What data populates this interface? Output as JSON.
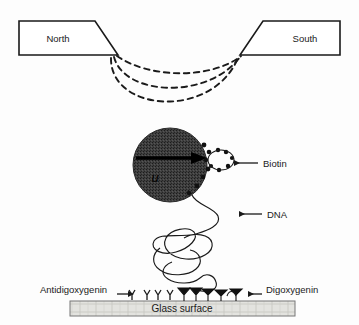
{
  "figure": {
    "type": "schematic-diagram",
    "background_color": "#fdfdfd",
    "line_color": "#1a1a1a"
  },
  "magnet": {
    "north_label": "North",
    "south_label": "South",
    "field_lines_count": 3,
    "field_line_style": "dashed"
  },
  "bead": {
    "fill_color": "#3a3a3a",
    "moment_symbol": "u",
    "moment_arrow_direction": "right"
  },
  "annotations": {
    "biotin": {
      "label": "Biotin",
      "arrow_direction": "left"
    },
    "dna": {
      "label": "DNA",
      "arrow_direction": "left"
    },
    "antidigoxygenin": {
      "label": "Antidigoxygenin",
      "arrow_direction": "right"
    },
    "digoxygenin": {
      "label": "Digoxygenin",
      "arrow_direction": "left"
    }
  },
  "surface": {
    "label": "Glass surface",
    "fill_color": "#dededa",
    "border_color": "#777777"
  },
  "linkers": {
    "open_antibody_count": 4,
    "filled_antibody_count": 5
  }
}
